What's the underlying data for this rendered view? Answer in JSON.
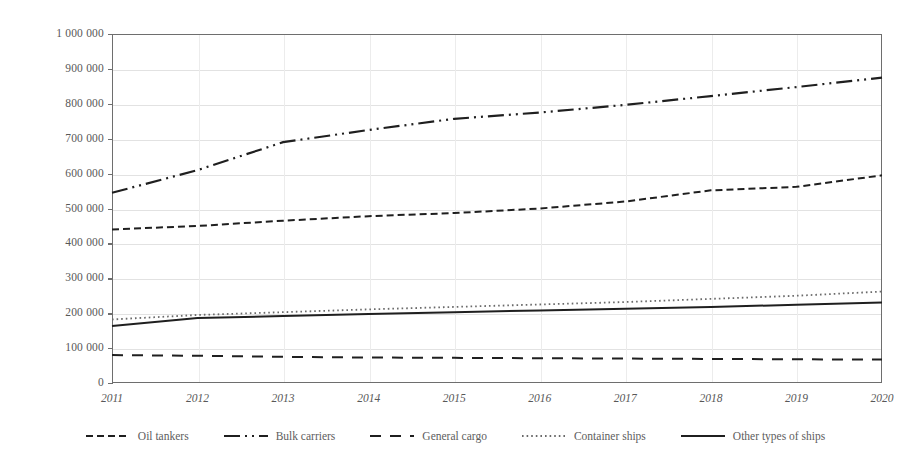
{
  "chart_data": {
    "type": "line",
    "title": "",
    "subtitle": "",
    "xlabel": "",
    "ylabel": "",
    "x": [
      2011,
      2012,
      2013,
      2014,
      2015,
      2016,
      2017,
      2018,
      2019,
      2020
    ],
    "categories": [
      "2011",
      "2012",
      "2013",
      "2014",
      "2015",
      "2016",
      "2017",
      "2018",
      "2019",
      "2020"
    ],
    "ylim": [
      0,
      1000000
    ],
    "ytick_values": [
      0,
      100000,
      200000,
      300000,
      400000,
      500000,
      600000,
      700000,
      800000,
      900000,
      1000000
    ],
    "ytick_labels": [
      "0",
      "100 000",
      "200 000",
      "300 000",
      "400 000",
      "500 000",
      "600 000",
      "700 000",
      "800 000",
      "900 000",
      "1 000 000"
    ],
    "grid": true,
    "legend_position": "bottom",
    "series": [
      {
        "name": "Oil tankers",
        "style": "dashed",
        "color": "#1f1f1f",
        "values": [
          440000,
          450000,
          465000,
          478000,
          487000,
          500000,
          520000,
          552000,
          562000,
          595000
        ]
      },
      {
        "name": "Bulk carriers",
        "style": "dash-dot-dot",
        "color": "#1f1f1f",
        "values": [
          545000,
          610000,
          690000,
          725000,
          757000,
          775000,
          797000,
          822000,
          848000,
          875000
        ]
      },
      {
        "name": "General cargo",
        "style": "long-dash",
        "color": "#1f1f1f",
        "values": [
          80000,
          78000,
          75000,
          73000,
          72000,
          71000,
          70000,
          69000,
          68000,
          67000
        ]
      },
      {
        "name": "Container ships",
        "style": "dotted",
        "color": "#6a6a6a",
        "values": [
          182000,
          195000,
          203000,
          211000,
          218000,
          225000,
          232000,
          241000,
          250000,
          262000
        ]
      },
      {
        "name": "Other types of ships",
        "style": "solid",
        "color": "#1f1f1f",
        "values": [
          163000,
          186000,
          192000,
          198000,
          203000,
          208000,
          213000,
          218000,
          224000,
          231000
        ]
      }
    ]
  },
  "legend": {
    "items": [
      {
        "label": "Oil tankers",
        "icon": "dashed-line-icon"
      },
      {
        "label": "Bulk carriers",
        "icon": "dash-dot-dot-line-icon"
      },
      {
        "label": "General cargo",
        "icon": "long-dash-line-icon"
      },
      {
        "label": "Container ships",
        "icon": "dotted-line-icon"
      },
      {
        "label": "Other types of ships",
        "icon": "solid-line-icon"
      }
    ]
  },
  "colors": {
    "axis": "#6e6e6e",
    "grid": "#e2e2e2",
    "text": "#585858",
    "background": "#ffffff"
  }
}
